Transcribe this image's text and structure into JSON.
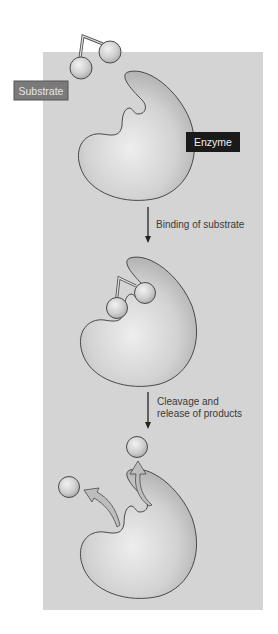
{
  "diagram": {
    "type": "enzyme-substrate-mechanism",
    "colors": {
      "panel_background": "#d4d4d4",
      "enzyme_fill_light": "#e8e8e8",
      "enzyme_fill_dark": "#b4b4b4",
      "outline": "#4a4a4a",
      "substrate_label_bg": "#7a7a7a",
      "substrate_label_text": "#e6e6e6",
      "enzyme_label_bg": "#1a1a1a",
      "enzyme_label_text": "#eeeeee",
      "release_arrow_fill": "#bdbdbd",
      "step_arrow": "#222222"
    },
    "labels": {
      "substrate": "Substrate",
      "enzyme": "Enzyme"
    },
    "steps": [
      {
        "line1": "Binding of substrate",
        "line2": ""
      },
      {
        "line1": "Cleavage and",
        "line2": "release of products"
      }
    ],
    "stages": [
      {
        "name": "free enzyme and substrate"
      },
      {
        "name": "enzyme-substrate complex"
      },
      {
        "name": "enzyme with released products"
      }
    ]
  }
}
